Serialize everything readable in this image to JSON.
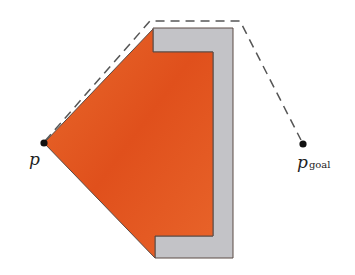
{
  "diagram": {
    "colors": {
      "region": "#e55a22",
      "obstacle": "#c2c2c6",
      "edge": "#5a4a44",
      "path": "#555555",
      "point": "#111111"
    },
    "start": {
      "label": "p",
      "x": 44,
      "y": 143
    },
    "goal": {
      "label": "p",
      "subscript": "goal",
      "x": 303,
      "y": 144
    },
    "path_description": "dashed shortest path from p around top of obstacle to p_goal"
  }
}
